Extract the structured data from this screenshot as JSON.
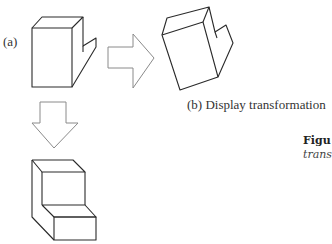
{
  "figure": {
    "label_a": "(a)",
    "label_b": "(b) Display transformation",
    "caption_title": "Figu",
    "caption_sub": "trans"
  },
  "colors": {
    "line": "#2a2a2a",
    "arrow": "#8a8a8a",
    "background": "#ffffff"
  },
  "shapes": [
    {
      "id": "original-object",
      "description": "L-shaped block, original view"
    },
    {
      "id": "rotated-object",
      "description": "L-shaped block after display transformation"
    },
    {
      "id": "transformed-object",
      "description": "Step-shaped block after model transformation"
    }
  ],
  "arrows": [
    {
      "id": "right-arrow",
      "direction": "right"
    },
    {
      "id": "down-arrow",
      "direction": "down"
    }
  ]
}
